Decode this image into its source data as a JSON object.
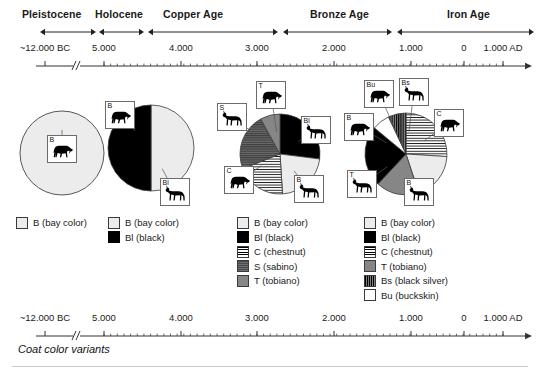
{
  "figure": {
    "caption": "Coat color variants",
    "periods": [
      {
        "name": "Pleistocene",
        "label_x": 22,
        "label_y": 8,
        "bar_start": 40,
        "bar_end": 96
      },
      {
        "name": "Holocene",
        "label_x": 95,
        "label_y": 8,
        "bar_start": 99,
        "bar_end": 144
      },
      {
        "name": "Copper Age",
        "label_x": 163,
        "label_y": 8,
        "bar_start": 148,
        "bar_end": 278
      },
      {
        "name": "Bronze Age",
        "label_x": 310,
        "label_y": 8,
        "bar_start": 283,
        "bar_end": 392
      },
      {
        "name": "Iron Age",
        "label_x": 447,
        "label_y": 8,
        "bar_start": 397,
        "bar_end": 534
      }
    ],
    "axis": {
      "break_x": 77,
      "ticks": [
        {
          "label": "~12.000 BC",
          "x": 45
        },
        {
          "label": "5.000",
          "x": 104
        },
        {
          "label": "4.000",
          "x": 181
        },
        {
          "label": "3.000",
          "x": 257
        },
        {
          "label": "2.000",
          "x": 334
        },
        {
          "label": "1.000",
          "x": 411
        },
        {
          "label": "0",
          "x": 464
        },
        {
          "label": "1.000 AD",
          "x": 503
        }
      ]
    },
    "legend_titles": {
      "B": "B (bay color)",
      "Bl": "Bl (black)",
      "C": "C (chestnut)",
      "S": "S (sabino)",
      "T": "T (tobiano)",
      "Bs": "Bs (black silver)",
      "Bu": "Bu (buckskin)"
    }
  },
  "chart_data": [
    {
      "type": "pie",
      "title": "Pleistocene",
      "cx": 62,
      "cy": 75,
      "r": 42,
      "categories": [
        "B (bay color)"
      ],
      "codes": [
        "B"
      ],
      "values": [
        100
      ],
      "legend": [
        {
          "code": "B",
          "label": "B (bay color)",
          "swatch": "sw-B"
        }
      ],
      "legend_x": 16,
      "legend_y": 6,
      "callouts": [
        {
          "code": "B",
          "box_x": 47,
          "box_y": 57,
          "w": 30,
          "h": 28,
          "horse": "grazing"
        }
      ]
    },
    {
      "type": "pie",
      "title": "Holocene",
      "cx": 151,
      "cy": 70,
      "r": 43,
      "categories": [
        "B (bay color)",
        "Bl (black)"
      ],
      "codes": [
        "B",
        "Bl"
      ],
      "values": [
        50,
        50
      ],
      "legend": [
        {
          "code": "B",
          "label": "B (bay color)",
          "swatch": "sw-B"
        },
        {
          "code": "Bl",
          "label": "Bl (black)",
          "swatch": "sw-Bl"
        }
      ],
      "legend_x": 108,
      "legend_y": 6,
      "callouts": [
        {
          "code": "B",
          "box_x": 105,
          "box_y": 23,
          "w": 30,
          "h": 28,
          "horse": "grazing"
        },
        {
          "code": "Bl",
          "box_x": 160,
          "box_y": 100,
          "w": 30,
          "h": 28,
          "horse": "standing"
        }
      ]
    },
    {
      "type": "pie",
      "title": "Copper Age",
      "cx": 280,
      "cy": 76,
      "r": 40,
      "categories": [
        "Bl (black)",
        "B (bay color)",
        "C (chestnut)",
        "S (sabino)",
        "T (tobiano)"
      ],
      "codes": [
        "Bl",
        "B",
        "C",
        "S",
        "T"
      ],
      "values": [
        27,
        22,
        20,
        23,
        8
      ],
      "legend": [
        {
          "code": "B",
          "label": "B (bay color)",
          "swatch": "sw-B"
        },
        {
          "code": "Bl",
          "label": "Bl (black)",
          "swatch": "sw-Bl"
        },
        {
          "code": "C",
          "label": "C (chestnut)",
          "swatch": "sw-C"
        },
        {
          "code": "S",
          "label": "S (sabino)",
          "swatch": "sw-S"
        },
        {
          "code": "T",
          "label": "T (tobiano)",
          "swatch": "sw-T"
        }
      ],
      "legend_x": 237,
      "legend_y": 6,
      "callouts": [
        {
          "code": "T",
          "box_x": 256,
          "box_y": 3,
          "w": 30,
          "h": 28,
          "horse": "grazing"
        },
        {
          "code": "S",
          "box_x": 217,
          "box_y": 25,
          "w": 30,
          "h": 28,
          "horse": "standing"
        },
        {
          "code": "Bl",
          "box_x": 301,
          "box_y": 38,
          "w": 30,
          "h": 28,
          "horse": "standing"
        },
        {
          "code": "C",
          "box_x": 224,
          "box_y": 88,
          "w": 30,
          "h": 28,
          "horse": "grazing"
        },
        {
          "code": "B",
          "box_x": 294,
          "box_y": 97,
          "w": 30,
          "h": 28,
          "horse": "standing"
        }
      ]
    },
    {
      "type": "pie",
      "title": "Bronze / Iron Age",
      "cx": 406,
      "cy": 76,
      "r": 41,
      "categories": [
        "C (chestnut)",
        "B (bay color)",
        "T (tobiano)",
        "Bl (black)",
        "Bu (buckskin)",
        "Bs (black silver)"
      ],
      "codes": [
        "C",
        "B",
        "T",
        "Bl",
        "Bu",
        "Bs"
      ],
      "values": [
        26,
        19,
        17,
        24,
        7,
        7
      ],
      "legend": [
        {
          "code": "B",
          "label": "B (bay color)",
          "swatch": "sw-B"
        },
        {
          "code": "Bl",
          "label": "Bl (black)",
          "swatch": "sw-Bl"
        },
        {
          "code": "C",
          "label": "C (chestnut)",
          "swatch": "sw-C"
        },
        {
          "code": "T",
          "label": "T (tobiano)",
          "swatch": "sw-T"
        },
        {
          "code": "Bs",
          "label": "Bs (black silver)",
          "swatch": "sw-Bs"
        },
        {
          "code": "Bu",
          "label": "Bu (buckskin)",
          "swatch": "sw-Bu"
        }
      ],
      "legend_x": 364,
      "legend_y": 6,
      "callouts": [
        {
          "code": "Bu",
          "box_x": 364,
          "box_y": 2,
          "w": 30,
          "h": 28,
          "horse": "grazing"
        },
        {
          "code": "Bs",
          "box_x": 399,
          "box_y": 0,
          "w": 30,
          "h": 28,
          "horse": "standing"
        },
        {
          "code": "B",
          "box_x": 344,
          "box_y": 35,
          "w": 30,
          "h": 28,
          "horse": "grazing"
        },
        {
          "code": "C",
          "box_x": 434,
          "box_y": 31,
          "w": 30,
          "h": 28,
          "horse": "grazing"
        },
        {
          "code": "T",
          "box_x": 347,
          "box_y": 92,
          "w": 30,
          "h": 28,
          "horse": "standing"
        },
        {
          "code": "B",
          "box_x": 404,
          "box_y": 100,
          "w": 30,
          "h": 28,
          "horse": "standing"
        }
      ]
    }
  ]
}
